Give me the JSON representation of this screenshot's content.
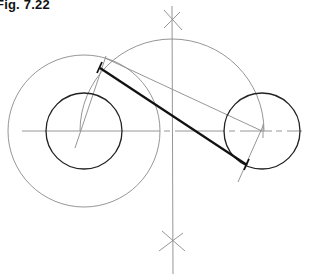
{
  "figure": {
    "label": "Fig. 7.22"
  },
  "colors": {
    "construction": "#8a8a8a",
    "outline": "#222222",
    "tangent": "#111111"
  },
  "geometry": {
    "left_circle": {
      "cx": 84,
      "cy": 131,
      "r": 38
    },
    "left_auxiliary_circle": {
      "cx": 84,
      "cy": 131,
      "r": 76
    },
    "right_circle": {
      "cx": 262,
      "cy": 131,
      "r": 38
    },
    "midpoint_arc": {
      "cx": 172,
      "cy": 131,
      "r": 92
    },
    "center_line_y": 131,
    "bisector_x": 172,
    "tangent_line": {
      "x1": 100,
      "y1": 68,
      "x2": 247,
      "y2": 164
    }
  }
}
